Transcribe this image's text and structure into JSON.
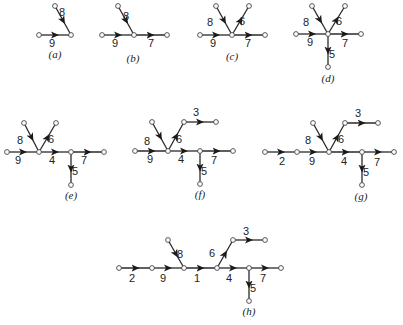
{
  "figure": {
    "colors": {
      "edge": "#2a2a2a",
      "node_stroke": "#444444",
      "background": "#ffffff"
    },
    "subfigures": [
      {
        "caption": "(a)",
        "caption_pos": [
          55,
          58
        ],
        "nodes": [
          [
            55,
            6
          ],
          [
            39,
            35
          ],
          [
            71,
            35
          ]
        ],
        "edges": [
          {
            "label": "8",
            "from": 0,
            "to": 2,
            "lx": 62,
            "ly": 16
          },
          {
            "label": "9",
            "from": 1,
            "to": 2,
            "lx": 52,
            "ly": 47
          }
        ]
      },
      {
        "caption": "(b)",
        "caption_pos": [
          133,
          62
        ],
        "nodes": [
          [
            118,
            6
          ],
          [
            102,
            35
          ],
          [
            134,
            35
          ],
          [
            167,
            35
          ]
        ],
        "edges": [
          {
            "label": "8",
            "from": 0,
            "to": 2,
            "lx": 126,
            "ly": 20
          },
          {
            "label": "9",
            "from": 1,
            "to": 2,
            "lx": 115,
            "ly": 47
          },
          {
            "label": "7",
            "from": 2,
            "to": 3,
            "lx": 151,
            "ly": 47
          }
        ]
      },
      {
        "caption": "(c)",
        "caption_pos": [
          232,
          60
        ],
        "nodes": [
          [
            216,
            6
          ],
          [
            249,
            6
          ],
          [
            200,
            35
          ],
          [
            232,
            35
          ],
          [
            265,
            35
          ]
        ],
        "edges": [
          {
            "label": "8",
            "from": 0,
            "to": 3,
            "lx": 210,
            "ly": 26
          },
          {
            "label": "6",
            "from": 3,
            "to": 1,
            "lx": 242,
            "ly": 25
          },
          {
            "label": "9",
            "from": 2,
            "to": 3,
            "lx": 213,
            "ly": 47
          },
          {
            "label": "7",
            "from": 3,
            "to": 4,
            "lx": 248,
            "ly": 47
          }
        ]
      },
      {
        "caption": "(d)",
        "caption_pos": [
          328,
          82
        ],
        "nodes": [
          [
            312,
            6
          ],
          [
            345,
            6
          ],
          [
            296,
            34
          ],
          [
            328,
            34
          ],
          [
            361,
            34
          ],
          [
            328,
            67
          ]
        ],
        "edges": [
          {
            "label": "8",
            "from": 0,
            "to": 3,
            "lx": 306,
            "ly": 26
          },
          {
            "label": "6",
            "from": 3,
            "to": 1,
            "lx": 339,
            "ly": 25
          },
          {
            "label": "9",
            "from": 2,
            "to": 3,
            "lx": 310,
            "ly": 46
          },
          {
            "label": "7",
            "from": 3,
            "to": 4,
            "lx": 345,
            "ly": 47
          },
          {
            "label": "5",
            "from": 3,
            "to": 5,
            "lx": 332,
            "ly": 58
          }
        ]
      },
      {
        "caption": "(e)",
        "caption_pos": [
          71,
          199
        ],
        "nodes": [
          [
            24,
            123
          ],
          [
            56,
            123
          ],
          [
            7,
            152
          ],
          [
            39,
            152
          ],
          [
            71,
            152
          ],
          [
            104,
            152
          ],
          [
            71,
            185
          ]
        ],
        "edges": [
          {
            "label": "8",
            "from": 0,
            "to": 3,
            "lx": 20,
            "ly": 144
          },
          {
            "label": "6",
            "from": 3,
            "to": 1,
            "lx": 51,
            "ly": 143
          },
          {
            "label": "9",
            "from": 2,
            "to": 3,
            "lx": 18,
            "ly": 164
          },
          {
            "label": "4",
            "from": 3,
            "to": 4,
            "lx": 52,
            "ly": 164
          },
          {
            "label": "7",
            "from": 4,
            "to": 5,
            "lx": 84,
            "ly": 164
          },
          {
            "label": "5",
            "from": 4,
            "to": 6,
            "lx": 75,
            "ly": 175
          }
        ]
      },
      {
        "caption": "(f)",
        "caption_pos": [
          200,
          198
        ],
        "nodes": [
          [
            152,
            122
          ],
          [
            184,
            122
          ],
          [
            216,
            122
          ],
          [
            135,
            151
          ],
          [
            168,
            151
          ],
          [
            200,
            151
          ],
          [
            233,
            151
          ],
          [
            200,
            184
          ]
        ],
        "edges": [
          {
            "label": "8",
            "from": 0,
            "to": 4,
            "lx": 147,
            "ly": 145
          },
          {
            "label": "6",
            "from": 4,
            "to": 1,
            "lx": 179,
            "ly": 143
          },
          {
            "label": "3",
            "from": 1,
            "to": 2,
            "lx": 196,
            "ly": 116
          },
          {
            "label": "9",
            "from": 3,
            "to": 4,
            "lx": 150,
            "ly": 163
          },
          {
            "label": "4",
            "from": 4,
            "to": 5,
            "lx": 181,
            "ly": 163
          },
          {
            "label": "7",
            "from": 5,
            "to": 6,
            "lx": 214,
            "ly": 164
          },
          {
            "label": "5",
            "from": 5,
            "to": 7,
            "lx": 204,
            "ly": 175
          }
        ]
      },
      {
        "caption": "(g)",
        "caption_pos": [
          361,
          200
        ],
        "nodes": [
          [
            313,
            123
          ],
          [
            345,
            123
          ],
          [
            378,
            123
          ],
          [
            265,
            152
          ],
          [
            297,
            152
          ],
          [
            329,
            152
          ],
          [
            362,
            152
          ],
          [
            394,
            152
          ],
          [
            362,
            185
          ]
        ],
        "edges": [
          {
            "label": "8",
            "from": 0,
            "to": 5,
            "lx": 308,
            "ly": 144
          },
          {
            "label": "6",
            "from": 5,
            "to": 1,
            "lx": 341,
            "ly": 143
          },
          {
            "label": "3",
            "from": 1,
            "to": 2,
            "lx": 358,
            "ly": 117
          },
          {
            "label": "2",
            "from": 3,
            "to": 4,
            "lx": 282,
            "ly": 165
          },
          {
            "label": "9",
            "from": 4,
            "to": 5,
            "lx": 312,
            "ly": 165
          },
          {
            "label": "4",
            "from": 5,
            "to": 6,
            "lx": 344,
            "ly": 165
          },
          {
            "label": "7",
            "from": 6,
            "to": 7,
            "lx": 377,
            "ly": 166
          },
          {
            "label": "5",
            "from": 6,
            "to": 8,
            "lx": 366,
            "ly": 176
          }
        ]
      },
      {
        "caption": "(h)",
        "caption_pos": [
          249,
          315
        ],
        "nodes": [
          [
            168,
            240
          ],
          [
            233,
            240
          ],
          [
            265,
            240
          ],
          [
            119,
            268
          ],
          [
            152,
            268
          ],
          [
            184,
            268
          ],
          [
            217,
            268
          ],
          [
            249,
            268
          ],
          [
            281,
            268
          ],
          [
            249,
            301
          ]
        ],
        "edges": [
          {
            "label": "8",
            "from": 0,
            "to": 5,
            "lx": 180,
            "ly": 258
          },
          {
            "label": "6",
            "from": 6,
            "to": 1,
            "lx": 212,
            "ly": 257
          },
          {
            "label": "3",
            "from": 1,
            "to": 2,
            "lx": 246,
            "ly": 235
          },
          {
            "label": "2",
            "from": 3,
            "to": 4,
            "lx": 132,
            "ly": 282
          },
          {
            "label": "9",
            "from": 4,
            "to": 5,
            "lx": 163,
            "ly": 282
          },
          {
            "label": "1",
            "from": 5,
            "to": 6,
            "lx": 197,
            "ly": 282
          },
          {
            "label": "4",
            "from": 6,
            "to": 7,
            "lx": 229,
            "ly": 282
          },
          {
            "label": "7",
            "from": 7,
            "to": 8,
            "lx": 263,
            "ly": 282
          },
          {
            "label": "5",
            "from": 7,
            "to": 9,
            "lx": 253,
            "ly": 292
          }
        ]
      }
    ]
  }
}
